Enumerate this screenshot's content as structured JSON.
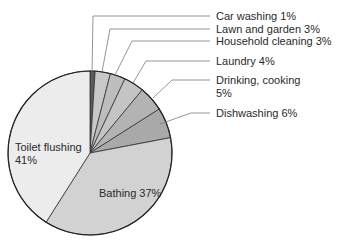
{
  "chart_data": {
    "type": "pie",
    "title": "",
    "start_angle_deg": 0,
    "direction": "clockwise",
    "slices": [
      {
        "label": "Car washing 1%",
        "category": "Car washing",
        "value": 1,
        "color": "#5a5a5a"
      },
      {
        "label": "Lawn and garden 3%",
        "category": "Lawn and garden",
        "value": 3,
        "color": "#c8c8c8"
      },
      {
        "label": "Household cleaning 3%",
        "category": "Household cleaning",
        "value": 3,
        "color": "#bdbdbd"
      },
      {
        "label": "Laundry 4%",
        "category": "Laundry",
        "value": 4,
        "color": "#c4c4c4"
      },
      {
        "label": "Drinking, cooking 5%",
        "category": "Drinking, cooking",
        "value": 5,
        "color": "#b3b3b3"
      },
      {
        "label": "Dishwashing 6%",
        "category": "Dishwashing",
        "value": 6,
        "color": "#a9a9a9"
      },
      {
        "label": "Bathing 37%",
        "category": "Bathing",
        "value": 37,
        "color": "#d2d2d2"
      },
      {
        "label": "Toilet flushing 41%",
        "category": "Toilet flushing",
        "value": 41,
        "color": "#ececec"
      }
    ],
    "legend": "none (callout labels)"
  },
  "labels": {
    "car": "Car washing 1%",
    "lawn": "Lawn and garden 3%",
    "household": "Household cleaning 3%",
    "laundry": "Laundry 4%",
    "drinking_1": "Drinking, cooking",
    "drinking_2": "5%",
    "dish": "Dishwashing 6%",
    "bathing": "Bathing 37%",
    "toilet_1": "Toilet flushing",
    "toilet_2": "41%"
  }
}
